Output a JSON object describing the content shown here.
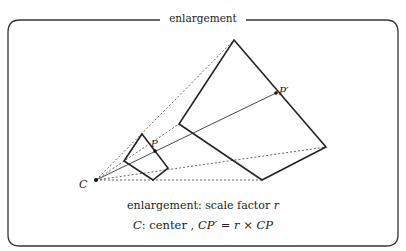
{
  "frame": {
    "title": "enlargement"
  },
  "labels": {
    "center": "C",
    "point": "P",
    "image_point": "P′"
  },
  "caption": {
    "line1_prefix": "enlargement: scale factor ",
    "line1_var": "r",
    "line2_var1": "C",
    "line2_text1": ": center , ",
    "line2_var2": "CP′",
    "line2_eq": " = ",
    "line2_var3": "r",
    "line2_times": " × ",
    "line2_var4": "CP"
  },
  "geometry": {
    "center": [
      96,
      180
    ],
    "small_quad": [
      [
        142,
        134
      ],
      [
        168,
        168
      ],
      [
        153,
        180
      ],
      [
        124,
        161
      ]
    ],
    "large_quad": [
      [
        234,
        40
      ],
      [
        326,
        147
      ],
      [
        262,
        180
      ],
      [
        179,
        124
      ]
    ],
    "P": [
      155,
      151
    ],
    "P_prime": [
      276,
      93
    ]
  },
  "colors": {
    "stroke": "#222222",
    "dotted": "#444444",
    "frame": "#333333"
  }
}
